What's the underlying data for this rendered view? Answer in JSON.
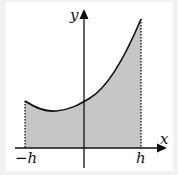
{
  "diagram": {
    "type": "area-under-curve",
    "axes": {
      "x_label": "x",
      "y_label": "y"
    },
    "ticks": {
      "left_label": "−h",
      "right_label": "h"
    },
    "colors": {
      "fill": "#c6c6c6",
      "stroke": "#111111",
      "background": "#ffffff",
      "frame": "#f2f2f2"
    },
    "region": {
      "description": "Shaded region under curve between x = −h and x = h",
      "bounds": [
        "−h",
        "h"
      ]
    }
  }
}
